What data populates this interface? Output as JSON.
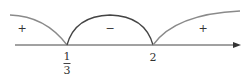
{
  "diagram": {
    "type": "sign-chart",
    "critical_points": [
      {
        "label_num": "1",
        "label_den": "3",
        "x": 67
      },
      {
        "label": "2",
        "x": 153
      }
    ],
    "signs": [
      {
        "text": "+",
        "x": 22,
        "y": 24
      },
      {
        "text": "−",
        "x": 110,
        "y": 24
      },
      {
        "text": "+",
        "x": 203,
        "y": 24
      }
    ],
    "colors": {
      "axis": "#444444",
      "outer_arcs": "#8a8a8a",
      "middle_arc": "#444444"
    }
  }
}
